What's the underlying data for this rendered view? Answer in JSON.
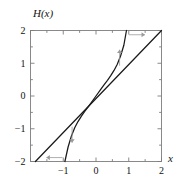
{
  "figure": {
    "title": "",
    "ylabel": "H(x)",
    "xlabel": "x",
    "background": "#ffffff",
    "curve_color": "#1a1a1a",
    "frame_color": "#7d7d7d",
    "arrow_color": "#9a9a9a"
  },
  "chart_data": {
    "type": "line",
    "title": "",
    "xlabel": "x",
    "ylabel": "H(x)",
    "xlim": [
      -2,
      2
    ],
    "ylim": [
      -2,
      2
    ],
    "grid": false,
    "legend": "none",
    "xticks": [
      -2,
      -1,
      0,
      1,
      2
    ],
    "xticklabels": [
      "-2",
      "-1",
      "0",
      "1",
      "2"
    ],
    "xtick_shown": [
      "-1",
      "0",
      "1",
      "2"
    ],
    "yticks": [
      -2,
      -1,
      0,
      1,
      2
    ],
    "yticklabels": [
      "-2",
      "-1",
      "0",
      "1",
      "2"
    ],
    "minor_ticks_per_interval": 1,
    "series": [
      {
        "name": "identity-line",
        "kind": "line",
        "description": "y = x diagonal reference line",
        "x": [
          -1.85,
          2.0
        ],
        "y": [
          -2.0,
          2.0
        ]
      },
      {
        "name": "H-curve",
        "kind": "cubic",
        "description": "S-shaped map H(x), steeper than y=x away from origin",
        "x": [
          -0.95,
          -0.85,
          -0.75,
          -0.65,
          -0.55,
          -0.45,
          -0.35,
          -0.25,
          -0.15,
          0.0,
          0.15,
          0.25,
          0.35,
          0.45,
          0.55,
          0.65,
          0.75,
          0.85,
          0.93
        ],
        "y": [
          -2.0,
          -1.55,
          -1.22,
          -0.97,
          -0.78,
          -0.62,
          -0.48,
          -0.35,
          -0.21,
          0.0,
          0.21,
          0.35,
          0.48,
          0.62,
          0.78,
          0.97,
          1.22,
          1.55,
          2.0
        ]
      }
    ],
    "annotations": [
      {
        "name": "arrow-top-right",
        "symbol": "right-arrow",
        "x": 1.25,
        "y": 1.87,
        "direction": "right"
      },
      {
        "name": "arrow-upper-mid",
        "symbol": "up-arrow",
        "x": 0.72,
        "y": 1.17,
        "direction": "up"
      },
      {
        "name": "arrow-lower-mid",
        "symbol": "down-arrow",
        "x": -0.73,
        "y": -1.18,
        "direction": "down"
      },
      {
        "name": "arrow-bottom-left",
        "symbol": "left-arrow",
        "x": -1.27,
        "y": -1.88,
        "direction": "left"
      }
    ]
  }
}
